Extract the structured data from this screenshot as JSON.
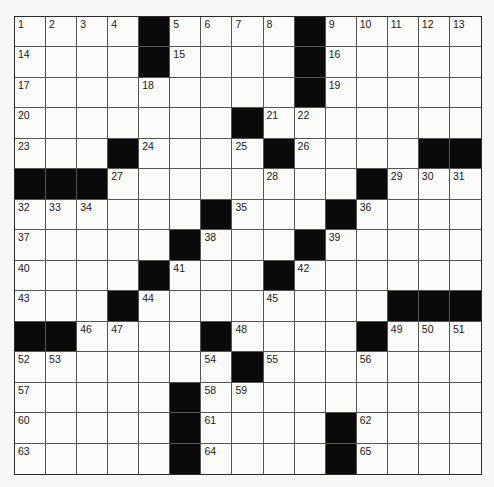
{
  "puzzle": {
    "type": "crossword",
    "rows": 15,
    "cols": 15,
    "colors": {
      "block": "#0a0a0a",
      "cell": "#fbfbfa",
      "line": "#555555"
    },
    "grid": [
      [
        "1",
        "2",
        "3",
        "4",
        "#",
        "5",
        "6",
        "7",
        "8",
        "#",
        "9",
        "10",
        "11",
        "12",
        "13"
      ],
      [
        "14",
        ".",
        ".",
        ".",
        "#",
        "15",
        ".",
        ".",
        ".",
        "#",
        "16",
        ".",
        ".",
        ".",
        "."
      ],
      [
        "17",
        ".",
        ".",
        ".",
        "18",
        ".",
        ".",
        ".",
        ".",
        "#",
        "19",
        ".",
        ".",
        ".",
        "."
      ],
      [
        "20",
        ".",
        ".",
        ".",
        ".",
        ".",
        ".",
        "#",
        "21",
        "22",
        ".",
        ".",
        ".",
        ".",
        "."
      ],
      [
        "23",
        ".",
        ".",
        "#",
        "24",
        ".",
        ".",
        "25",
        "#",
        "26",
        ".",
        ".",
        ".",
        "#",
        "#"
      ],
      [
        "#",
        "#",
        "#",
        "27",
        ".",
        ".",
        ".",
        ".",
        "28",
        ".",
        ".",
        "#",
        "29",
        "30",
        "31"
      ],
      [
        "32",
        "33",
        "34",
        ".",
        ".",
        ".",
        "#",
        "35",
        ".",
        ".",
        "#",
        "36",
        ".",
        ".",
        "."
      ],
      [
        "37",
        ".",
        ".",
        ".",
        ".",
        "#",
        "38",
        ".",
        ".",
        "#",
        "39",
        ".",
        ".",
        ".",
        "."
      ],
      [
        "40",
        ".",
        ".",
        ".",
        "#",
        "41",
        ".",
        ".",
        "#",
        "42",
        ".",
        ".",
        ".",
        ".",
        "."
      ],
      [
        "43",
        ".",
        ".",
        "#",
        "44",
        ".",
        ".",
        ".",
        "45",
        ".",
        ".",
        ".",
        "#",
        "#",
        "#"
      ],
      [
        "#",
        "#",
        "46",
        "47",
        ".",
        ".",
        "#",
        "48",
        ".",
        ".",
        ".",
        "#",
        "49",
        "50",
        "51"
      ],
      [
        "52",
        "53",
        ".",
        ".",
        ".",
        ".",
        "54",
        "#",
        "55",
        ".",
        ".",
        "56",
        ".",
        ".",
        "."
      ],
      [
        "57",
        ".",
        ".",
        ".",
        ".",
        "#",
        "58",
        "59",
        ".",
        ".",
        ".",
        ".",
        ".",
        ".",
        "."
      ],
      [
        "60",
        ".",
        ".",
        ".",
        ".",
        "#",
        "61",
        ".",
        ".",
        ".",
        "#",
        "62",
        ".",
        ".",
        "."
      ],
      [
        "63",
        ".",
        ".",
        ".",
        ".",
        "#",
        "64",
        ".",
        ".",
        ".",
        "#",
        "65",
        ".",
        ".",
        "."
      ]
    ]
  }
}
